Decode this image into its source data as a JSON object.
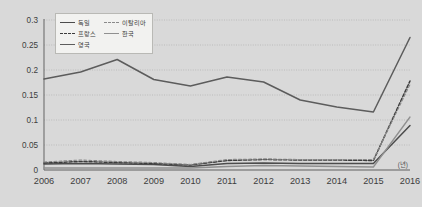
{
  "chart_data": {
    "type": "line",
    "title": "",
    "xlabel": "(년)",
    "ylabel": "",
    "x": [
      2006,
      2007,
      2008,
      2009,
      2010,
      2011,
      2012,
      2013,
      2014,
      2015,
      2016
    ],
    "categories": [
      "2006",
      "2007",
      "2008",
      "2009",
      "2010",
      "2011",
      "2012",
      "2013",
      "2014",
      "2015",
      "2016"
    ],
    "ylim": [
      0,
      0.3
    ],
    "xlim": [
      2006,
      2016
    ],
    "ytick_labels": [
      "0",
      "0.05",
      "0.1",
      "0.15",
      "0.2",
      "0.25",
      "0.3"
    ],
    "ytick_values": [
      0,
      0.05,
      0.1,
      0.15,
      0.2,
      0.25,
      0.3
    ],
    "grid": true,
    "grid_axis": "y",
    "legend_position": "top-left",
    "series": [
      {
        "name": "독일",
        "style": "solid",
        "color": "#4c4c4c",
        "width": 1.5,
        "values": [
          0.012,
          0.013,
          0.012,
          0.011,
          0.007,
          0.013,
          0.014,
          0.013,
          0.013,
          0.013,
          0.089
        ]
      },
      {
        "name": "프랑스",
        "style": "dashed",
        "color": "#3c3c3c",
        "width": 1.5,
        "values": [
          0.014,
          0.017,
          0.015,
          0.013,
          0.01,
          0.019,
          0.021,
          0.02,
          0.02,
          0.019,
          0.178
        ]
      },
      {
        "name": "이탈리아",
        "style": "dashed-thin",
        "color": "#8a8a8a",
        "width": 1.1,
        "values": [
          0.016,
          0.02,
          0.017,
          0.015,
          0.011,
          0.021,
          0.022,
          0.021,
          0.021,
          0.021,
          0.171
        ]
      },
      {
        "name": "한국",
        "style": "solid",
        "color": "#909090",
        "width": 1.3,
        "values": [
          0.004,
          0.004,
          0.004,
          0.004,
          0.004,
          0.007,
          0.009,
          0.008,
          0.007,
          0.006,
          0.106
        ]
      },
      {
        "name": "영국",
        "style": "solid",
        "color": "#5c5c5c",
        "width": 1.5,
        "values": [
          0.182,
          0.196,
          0.221,
          0.181,
          0.168,
          0.186,
          0.176,
          0.14,
          0.126,
          0.116,
          0.265
        ]
      }
    ]
  },
  "legend": {
    "rows": [
      [
        {
          "name": "독일",
          "style": "solid",
          "color": "#4c4c4c"
        },
        {
          "name": "이탈리아",
          "style": "dashed-thin",
          "color": "#8a8a8a"
        }
      ],
      [
        {
          "name": "프랑스",
          "style": "dashed",
          "color": "#3c3c3c"
        },
        {
          "name": "한국",
          "style": "solid",
          "color": "#909090"
        }
      ],
      [
        {
          "name": "영국",
          "style": "solid",
          "color": "#5c5c5c"
        }
      ]
    ]
  },
  "axes": {
    "x_unit_label": "(년)",
    "y_labels": [
      "0.3",
      "0.25",
      "0.2",
      "0.15",
      "0.1",
      "0.05",
      "0"
    ],
    "x_labels": [
      "2006",
      "2007",
      "2008",
      "2009",
      "2010",
      "2011",
      "2012",
      "2013",
      "2014",
      "2015",
      "2016"
    ]
  },
  "colors": {
    "background": "#d9d9d9",
    "plot_background": "#d9d9d9",
    "gridline": "#b0b0b0",
    "axis": "#6e6e6e",
    "tick_text": "#3d3d3d",
    "legend_background": "#f2f2f0",
    "legend_border": "#b9b9b5"
  }
}
